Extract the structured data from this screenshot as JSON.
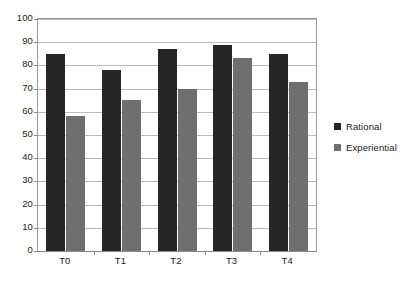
{
  "chart_data": {
    "type": "bar",
    "title": "",
    "xlabel": "",
    "ylabel": "",
    "categories": [
      "T0",
      "T1",
      "T2",
      "T3",
      "T4"
    ],
    "series": [
      {
        "name": "Rational",
        "color": "#262626",
        "values": [
          85,
          78,
          87,
          89,
          85
        ]
      },
      {
        "name": "Experiential",
        "color": "#6f6f6f",
        "values": [
          58,
          65,
          70,
          83,
          73
        ]
      }
    ],
    "ylim": [
      0,
      100
    ],
    "ytick_step": 10,
    "yticks": [
      0,
      10,
      20,
      30,
      40,
      50,
      60,
      70,
      80,
      90,
      100
    ],
    "ytick_labels": [
      "0",
      "10",
      "20",
      "30",
      "40",
      "50",
      "60",
      "70",
      "80",
      "90",
      "100"
    ],
    "grid": true,
    "grid_axis": "y",
    "legend_position": "right",
    "background_color": "#ffffff",
    "grid_color": "#b9b9b9",
    "axis_color": "#8a8a8a"
  },
  "legend": {
    "items": [
      {
        "label": "Rational",
        "color": "#262626"
      },
      {
        "label": "Experiential",
        "color": "#6f6f6f"
      }
    ]
  }
}
